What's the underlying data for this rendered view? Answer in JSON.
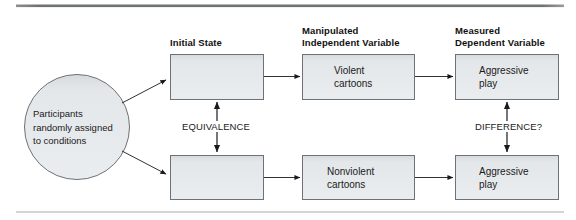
{
  "figure": {
    "title_rule_color": "#6f7275",
    "bottom_rule_color": "#9a9da0",
    "box_fill": "#e7eaec",
    "box_fill_top": "#d9dde0",
    "box_stroke": "#6e7276",
    "circle_fill": "#e7eaec",
    "circle_stroke": "#6e7276",
    "arrow_color": "#1a1a1a"
  },
  "headers": {
    "initial_state": "Initial State",
    "independent_variable": "Manipulated\nIndependent Variable",
    "dependent_variable": "Measured\nDependent Variable"
  },
  "source": {
    "label": "Participants\nrandomly assigned\nto conditions"
  },
  "boxes": {
    "initial_state_top": "",
    "initial_state_bottom": "",
    "iv_top": "Violent\ncartoons",
    "iv_bottom": "Nonviolent\ncartoons",
    "dv_top": "Aggressive\nplay",
    "dv_bottom": "Aggressive\nplay"
  },
  "relations": {
    "equivalence": "EQUIVALENCE",
    "difference": "DIFFERENCE?"
  }
}
